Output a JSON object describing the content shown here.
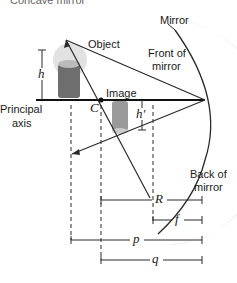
{
  "title_clipped": "Concave mirror",
  "labels": {
    "mirror": "Mirror",
    "front_of_mirror_1": "Front of",
    "front_of_mirror_2": "mirror",
    "object": "Object",
    "image": "Image",
    "principal_axis_1": "Principal",
    "principal_axis_2": "axis",
    "center_of_curvature": "C",
    "object_height": "h",
    "image_height": "h′",
    "back_of_mirror_1": "Back of",
    "back_of_mirror_2": "mirror",
    "radius": "R",
    "focal_length": "f",
    "object_distance": "p",
    "image_distance": "q"
  },
  "colors": {
    "line": "#2a2a2a",
    "mirror_glow": "#e6e6e6",
    "candle": "#7a7a7a"
  }
}
